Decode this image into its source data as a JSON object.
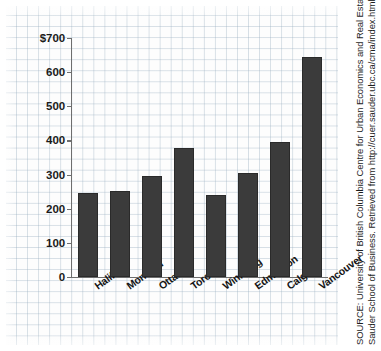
{
  "chart_data": {
    "type": "bar",
    "title": "",
    "subtitle": "",
    "xlabel": "",
    "ylabel": "",
    "categories": [
      "Halifax",
      "Montreal",
      "Ottawa",
      "Toronto",
      "Winnipeg",
      "Edmonton",
      "Calgary",
      "Vancouver"
    ],
    "values": [
      245,
      253,
      295,
      378,
      240,
      306,
      395,
      645
    ],
    "ylim": [
      0,
      700
    ],
    "ytick_values": [
      0,
      100,
      200,
      300,
      400,
      500,
      600,
      700
    ],
    "ytick_labels": [
      "0",
      "100",
      "200",
      "300",
      "400",
      "500",
      "600",
      "$700"
    ],
    "grid": true,
    "grid_style": "graph-paper-background",
    "legend": null,
    "legend_position": "none",
    "bar_color": "#3b3b3b",
    "axis_color": "#6e6e6e",
    "annotations": []
  },
  "source": {
    "line1": "SOURCE: University of British Columbia Centre for Urban Economics and Real Estate,",
    "line2": "Sauder School of Business. Retrieved from http://cuer.sauder.ubc.ca/cma/index.html"
  },
  "colors": {
    "background": "#ffffff",
    "grid": "#96acbe",
    "bar": "#3b3b3b",
    "axis": "#6e6e6e",
    "text": "#1b1b1b"
  }
}
